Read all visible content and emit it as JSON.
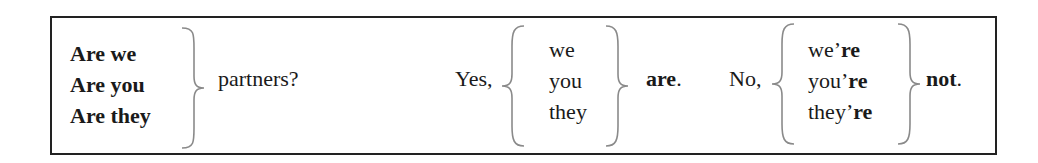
{
  "table": {
    "questions": {
      "subjects": [
        "Are we",
        "Are you",
        "Are they"
      ],
      "complement": "partners?"
    },
    "affirmative": {
      "lead": "Yes,",
      "pronouns": [
        "we",
        "you",
        "they"
      ],
      "verb": "are",
      "end": "."
    },
    "negative": {
      "lead": "No,",
      "contractions": [
        {
          "base": "we’",
          "suffix": "re"
        },
        {
          "base": "you’",
          "suffix": "re"
        },
        {
          "base": "they’",
          "suffix": "re"
        }
      ],
      "word": "not",
      "end": "."
    }
  },
  "colors": {
    "border": "#222222",
    "brace": "#8a8a8a",
    "text": "#1a1a1a"
  }
}
